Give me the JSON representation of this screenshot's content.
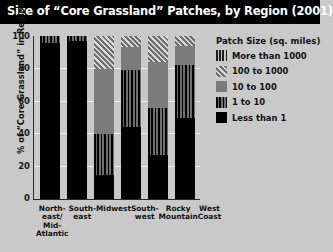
{
  "title": "Size of “Core Grassland” Patches, by Region (2001)",
  "legend": {
    "heading": "Patch Size (sq. miles)",
    "items": [
      {
        "label": "More than 1000",
        "pattern": "p-gt1000"
      },
      {
        "label": "100 to 1000",
        "pattern": "p-100to1000"
      },
      {
        "label": "10 to 100",
        "pattern": "p-10to100"
      },
      {
        "label": "1 to 10",
        "pattern": "p-1to10"
      },
      {
        "label": "Less than 1",
        "pattern": "p-lt1"
      }
    ]
  },
  "axes": {
    "ylabel": "% of “Core Grassland” in Region",
    "yticks": [
      "100",
      "80",
      "60",
      "40",
      "20",
      "0"
    ]
  },
  "chart_data": {
    "type": "bar",
    "subtype": "stacked-bar-100-percent",
    "title": "Size of “Core Grassland” Patches, by Region (2001)",
    "xlabel": "",
    "ylabel": "% of “Core Grassland” in Region",
    "ylim": [
      0,
      100
    ],
    "ytick_values": [
      0,
      20,
      40,
      60,
      80,
      100
    ],
    "grid": true,
    "legend_position": "right",
    "legend_title": "Patch Size (sq. miles)",
    "categories": [
      "North-east/ Mid-Atlantic",
      "South-east",
      "Midwest",
      "South-west",
      "Rocky Mountain",
      "West Coast"
    ],
    "category_lines": [
      [
        "North-",
        "east/",
        "Mid-",
        "Atlantic"
      ],
      [
        "South-",
        "east"
      ],
      [
        "Midwest"
      ],
      [
        "South-",
        "west"
      ],
      [
        "Rocky",
        "Mountain"
      ],
      [
        "West",
        "Coast"
      ]
    ],
    "series": [
      {
        "name": "Less than 1",
        "values": [
          96,
          97,
          15,
          44,
          27,
          50
        ]
      },
      {
        "name": "1 to 10",
        "values": [
          4,
          3,
          25,
          35,
          29,
          32
        ]
      },
      {
        "name": "10 to 100",
        "values": [
          0,
          0,
          40,
          14,
          28,
          12
        ]
      },
      {
        "name": "100 to 1000",
        "values": [
          0,
          0,
          20,
          7,
          16,
          6
        ]
      },
      {
        "name": "More than 1000",
        "values": [
          0,
          0,
          0,
          0,
          0,
          0
        ]
      }
    ],
    "cumulative_tops": {
      "North-east/ Mid-Atlantic": [
        96,
        100,
        100,
        100,
        100
      ],
      "South-east": [
        97,
        100,
        100,
        100,
        100
      ],
      "Midwest": [
        15,
        40,
        80,
        100,
        100
      ],
      "South-west": [
        44,
        79,
        93,
        100,
        100
      ],
      "Rocky Mountain": [
        27,
        56,
        84,
        100,
        100
      ],
      "West Coast": [
        50,
        82,
        94,
        100,
        100
      ]
    }
  },
  "colors": {
    "titlebar_bg": "#000000",
    "titlebar_text": "#ffffff",
    "page_bg": "#c9c9c9",
    "axis": "#2a2a2a",
    "gridline": "#efefef",
    "less_than_1": "#000000",
    "one_to_ten": "#3a3a3a",
    "ten_to_hundred": "#7b7b7b",
    "hundred_to_thousand": "#8a8a8a",
    "more_than_1000": "#9a9a9a"
  }
}
